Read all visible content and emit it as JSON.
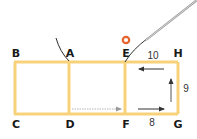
{
  "diagram": {
    "points": {
      "A": "A",
      "B": "B",
      "C": "C",
      "D": "D",
      "E": "E",
      "F": "F",
      "G": "G",
      "H": "H"
    },
    "measurements": {
      "top_right": "10",
      "right_side": "9",
      "bottom_right": "8"
    },
    "colors": {
      "stitch_line": "#f7d27a",
      "needle_thread": "#8a8a8a",
      "needle": "#c8c8c8",
      "ring": "#e8632b",
      "arrow": "#333333",
      "dotted_arrow": "#b5b5b5"
    }
  }
}
